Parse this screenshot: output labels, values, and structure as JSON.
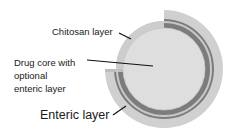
{
  "diagram": {
    "type": "cross-section",
    "labels": {
      "chitosan": "Chitosan layer",
      "core_line1": "Drug core with",
      "core_line2": "optional",
      "core_line3": "enteric layer",
      "enteric": "Enteric layer"
    },
    "colors": {
      "core": "#dcdcdc",
      "chitosan": "#c9c9c9",
      "enteric_band": "#7a7a7a",
      "outer_layer": "#cfcfcf",
      "leader_line": "#111111"
    }
  }
}
